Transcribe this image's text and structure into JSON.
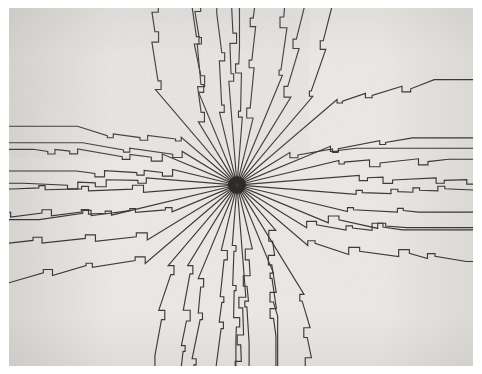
{
  "image": {
    "kind": "optical-illusion-figure",
    "title": "Radial sunburst with stepped rectilinear rays",
    "width": 482,
    "height": 374
  },
  "plate": {
    "x": 9,
    "y": 8,
    "width": 464,
    "height": 358,
    "background_color": "#e9e7e4",
    "page_color": "#ffffff"
  },
  "figure": {
    "center_x": 237,
    "center_y": 185,
    "ray_count": 40,
    "angle_step_degrees": 9,
    "angle_offset_degrees": 4.5,
    "line_color": "#3d3b39",
    "line_width": 1.15,
    "hub_radius": 9,
    "hub_color": "#2b2927",
    "break_radius_min": 58,
    "break_radius_max": 132,
    "step_count_min": 2,
    "step_count_max": 4,
    "step_size_min": 6,
    "step_size_max": 13,
    "seed": 20240917
  },
  "chart_data": {
    "type": "line",
    "xlabel": "",
    "ylabel": "",
    "xlim": [
      9,
      473
    ],
    "ylim": [
      8,
      366
    ],
    "grid": false,
    "legend": "none",
    "series": [
      {
        "name": "radial-rays",
        "count": 40,
        "note": "straight segments from hub to break radius"
      },
      {
        "name": "staircase-transitions",
        "count": 40,
        "note": "2-4 axis-aligned notch steps per ray"
      },
      {
        "name": "edge-runs",
        "count": 40,
        "note": "horizontal or vertical runs to plate border"
      }
    ]
  }
}
